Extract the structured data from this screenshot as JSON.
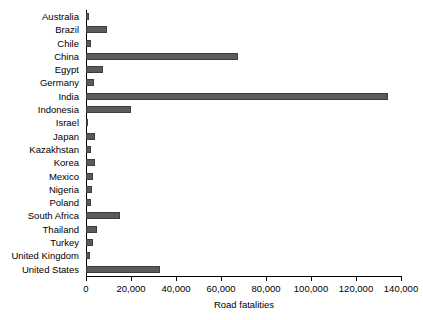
{
  "chart_data": {
    "type": "bar",
    "orientation": "horizontal",
    "title": "",
    "xlabel": "Road fatalities",
    "ylabel": "",
    "xlim": [
      0,
      140000
    ],
    "xticks": [
      0,
      20000,
      40000,
      60000,
      80000,
      100000,
      120000,
      140000
    ],
    "xticklabels": [
      "0",
      "20,000",
      "40,000",
      "60,000",
      "80,000",
      "100,000",
      "120,000",
      "140,000"
    ],
    "grid": false,
    "legend": null,
    "bar_color": "#5b5b5b",
    "categories": [
      "Australia",
      "Brazil",
      "Chile",
      "China",
      "Egypt",
      "Germany",
      "India",
      "Indonesia",
      "Israel",
      "Japan",
      "Kazakhstan",
      "Korea",
      "Mexico",
      "Nigeria",
      "Poland",
      "South Africa",
      "Thailand",
      "Turkey",
      "United Kingdom",
      "United States"
    ],
    "values": [
      1300,
      9300,
      2000,
      67500,
      7700,
      3500,
      134000,
      20000,
      400,
      4100,
      2000,
      4200,
      3200,
      2800,
      2300,
      15000,
      5000,
      3200,
      1800,
      33000
    ]
  }
}
